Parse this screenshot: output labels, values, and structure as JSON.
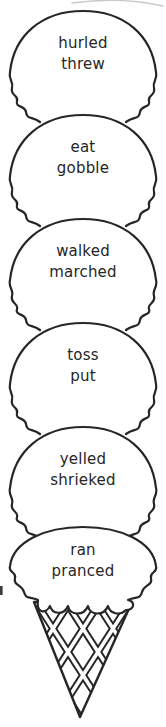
{
  "graphic": {
    "description_visible_text_only": "",
    "scoops": [
      {
        "word1": "hurled",
        "word2": "threw"
      },
      {
        "word1": "eat",
        "word2": "gobble"
      },
      {
        "word1": "walked",
        "word2": "marched"
      },
      {
        "word1": "toss",
        "word2": "put"
      },
      {
        "word1": "yelled",
        "word2": "shrieked"
      },
      {
        "word1": "ran",
        "word2": "pranced"
      }
    ]
  },
  "colors": {
    "ink": "#262626",
    "paper": "#ffffff",
    "faint": "#c9c9c9",
    "smudge": "#3a3a3a"
  }
}
